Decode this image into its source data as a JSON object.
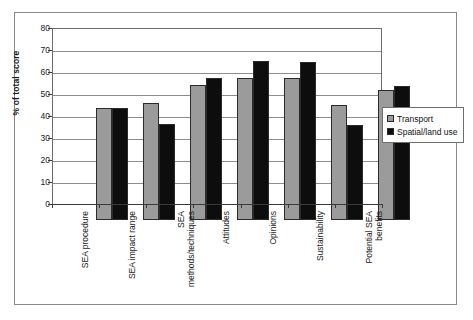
{
  "chart_data": {
    "type": "bar",
    "title": "",
    "xlabel": "",
    "ylabel": "% of total score",
    "ylim": [
      0,
      80
    ],
    "ytick_step": 10,
    "yticks": [
      80,
      70,
      60,
      50,
      40,
      30,
      20,
      10,
      0
    ],
    "grid": true,
    "grid_axis": "y",
    "legend_position": "right",
    "categories": [
      "SEA procedure",
      "SEA impact range",
      "SEA\nmethods/techniques",
      "Attitudes",
      "Opinions",
      "Sustainability",
      "Potential SEA\nbenefits"
    ],
    "series": [
      {
        "name": "Transport",
        "color": "#9b9b9b",
        "values": [
          51,
          53,
          61.5,
          64.5,
          64.5,
          52.5,
          59
        ]
      },
      {
        "name": "Spatial/land use",
        "color": "#0d0d0d",
        "values": [
          51,
          43.5,
          64.5,
          72.5,
          72,
          43,
          61
        ]
      }
    ]
  },
  "legend": {
    "entries": [
      {
        "label": "Transport",
        "swatch": "transport"
      },
      {
        "label": "Spatial/land use",
        "swatch": "spatial"
      }
    ]
  }
}
